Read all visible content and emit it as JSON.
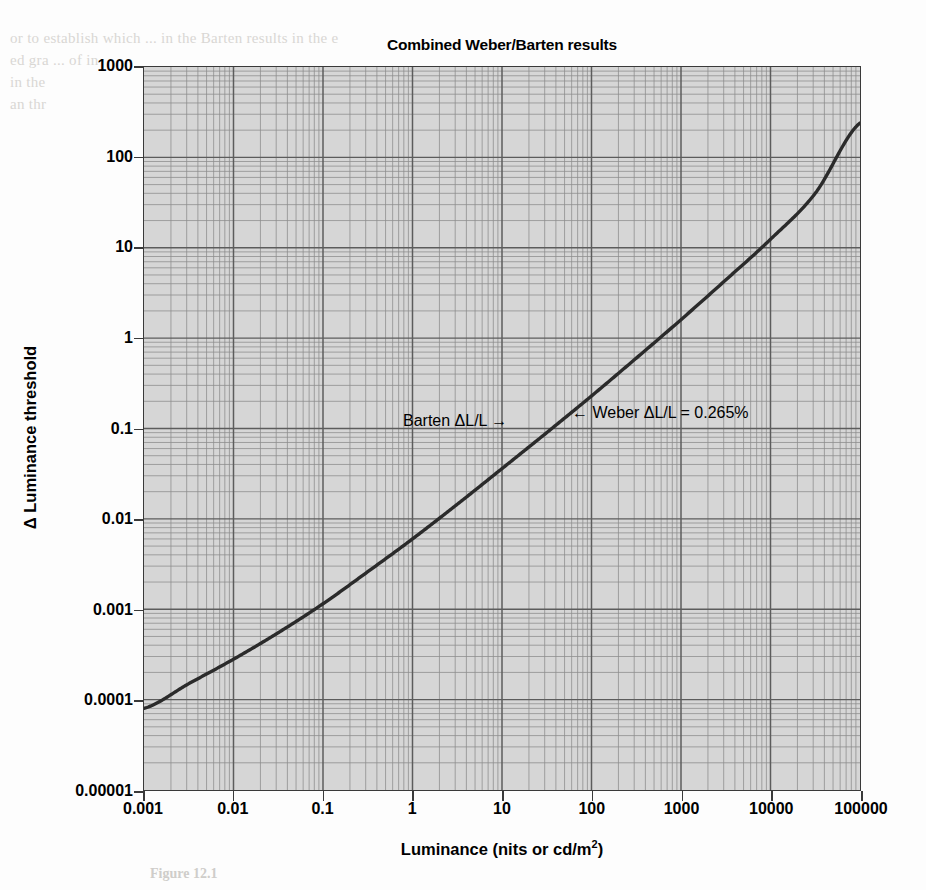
{
  "figure": {
    "title": "Combined Weber/Barten results",
    "caption": "Figure 12.1"
  },
  "chart_data": {
    "type": "line",
    "title": "Combined Weber/Barten results",
    "xlabel": "Luminance (nits or cd/m2)",
    "xlabel_html": "Luminance (nits or cd/m<sup>2</sup>)",
    "ylabel": "Δ Luminance threshold",
    "xscale": "log",
    "yscale": "log",
    "xlim": [
      0.001,
      100000
    ],
    "ylim": [
      1e-05,
      1000
    ],
    "grid": true,
    "grid_minor": true,
    "legend": "none",
    "xticks": [
      "0.001",
      "0.01",
      "0.1",
      "1",
      "10",
      "100",
      "1000",
      "10000",
      "100000"
    ],
    "xtick_values": [
      0.001,
      0.01,
      0.1,
      1,
      10,
      100,
      1000,
      10000,
      100000
    ],
    "yticks": [
      "1000",
      "100",
      "10",
      "1",
      "0.1",
      "0.01",
      "0.001",
      "0.0001",
      "0.00001"
    ],
    "ytick_values": [
      1000,
      100,
      10,
      1,
      0.1,
      0.01,
      0.001,
      0.0001,
      1e-05
    ],
    "series": [
      {
        "name": "Combined Weber/Barten threshold",
        "color": "#2b2b2b",
        "linewidth": 3.4,
        "x": [
          0.001,
          0.00316,
          0.01,
          0.0316,
          0.1,
          0.316,
          1,
          3.16,
          10,
          31.6,
          100,
          316,
          1000,
          3160,
          10000,
          31600,
          100000
        ],
        "y": [
          8e-05,
          0.00015,
          0.00028,
          0.00055,
          0.00115,
          0.0026,
          0.006,
          0.0145,
          0.036,
          0.09,
          0.229,
          0.6,
          1.6,
          4.4,
          12.4,
          40.0,
          240.0
        ]
      }
    ],
    "annotations": [
      {
        "name": "barten-annotation",
        "text": "Barten ΔL/L →",
        "x_data": 1.9,
        "y_data": 0.115
      },
      {
        "name": "weber-annotation",
        "text": "← Weber ΔL/L = 0.265%",
        "x_data": 70,
        "y_data": 0.155
      }
    ]
  },
  "bleed_text": {
    "lines": [
      "or to establish which ... in the Barten results in the e",
      "ed gra ... of in",
      "in the",
      "an thr"
    ]
  }
}
